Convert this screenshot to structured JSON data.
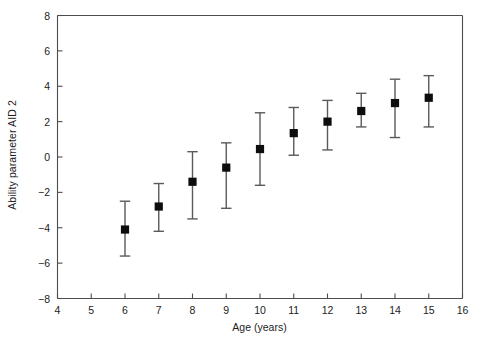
{
  "chart_data": {
    "type": "scatter",
    "title": "",
    "xlabel": "Age (years)",
    "ylabel": "Ability parameter AID 2",
    "xlim": [
      4,
      16
    ],
    "ylim": [
      -8,
      8
    ],
    "xticks": [
      4,
      5,
      6,
      7,
      8,
      9,
      10,
      11,
      12,
      13,
      14,
      15,
      16
    ],
    "yticks": [
      -8,
      -6,
      -4,
      -2,
      0,
      2,
      4,
      6,
      8
    ],
    "grid": false,
    "legend": null,
    "marker": "filled-square",
    "errorbars": true,
    "series": [
      {
        "name": "Ability parameter AID 2",
        "x": [
          6,
          7,
          8,
          9,
          10,
          11,
          12,
          13,
          14,
          15
        ],
        "values": [
          -4.1,
          -2.8,
          -1.4,
          -0.6,
          0.45,
          1.35,
          2.0,
          2.6,
          3.05,
          3.35
        ],
        "err_low": [
          -5.6,
          -4.2,
          -3.5,
          -2.9,
          -1.6,
          0.1,
          0.4,
          1.7,
          1.1,
          1.7
        ],
        "err_high": [
          -2.5,
          -1.5,
          0.3,
          0.8,
          2.5,
          2.8,
          3.2,
          3.6,
          4.4,
          4.6
        ]
      }
    ]
  },
  "axes": {
    "x_tick_labels": [
      "4",
      "5",
      "6",
      "7",
      "8",
      "9",
      "10",
      "11",
      "12",
      "13",
      "14",
      "15",
      "16"
    ],
    "y_tick_labels": [
      "8",
      "6",
      "4",
      "2",
      "0",
      "−2",
      "−4",
      "−6",
      "−8"
    ]
  },
  "style": {
    "axis_color": "#4d4d4d",
    "marker_color": "#0d0d0d",
    "errorbar_color": "#5a5a5a",
    "background": "#ffffff",
    "text_color": "#1c1c1c"
  }
}
